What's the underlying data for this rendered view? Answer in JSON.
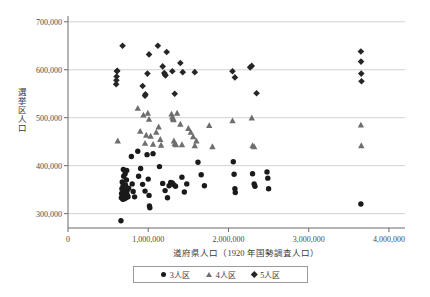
{
  "chart_data": {
    "type": "scatter",
    "title": "",
    "xlabel": "道府県人口（1920 年国勢調査人口）",
    "ylabel": "選挙区人口",
    "xlim": [
      0,
      4200000
    ],
    "ylim": [
      270000,
      710000
    ],
    "grid": "horizontal",
    "legend_position": "bottom-center",
    "x_ticks": [
      {
        "value": 0,
        "label": "0"
      },
      {
        "value": 1000000,
        "label": "1,000,000"
      },
      {
        "value": 2000000,
        "label": "2,000,000"
      },
      {
        "value": 3000000,
        "label": "3,000,000"
      },
      {
        "value": 4000000,
        "label": "4,000,000"
      }
    ],
    "y_ticks": [
      {
        "value": 300000,
        "label": "300,000"
      },
      {
        "value": 400000,
        "label": "400,000"
      },
      {
        "value": 500000,
        "label": "500,000"
      },
      {
        "value": 600000,
        "label": "600,000"
      },
      {
        "value": 700000,
        "label": "700,000"
      }
    ],
    "series": [
      {
        "name": "3人区",
        "marker": "circle",
        "color": "#1a1a1a",
        "points": [
          [
            660000,
            285000
          ],
          [
            665000,
            333000
          ],
          [
            668000,
            342000
          ],
          [
            672000,
            352000
          ],
          [
            676000,
            366000
          ],
          [
            680000,
            337000
          ],
          [
            683000,
            330000
          ],
          [
            686000,
            358000
          ],
          [
            690000,
            392000
          ],
          [
            694000,
            378000
          ],
          [
            697000,
            345000
          ],
          [
            700000,
            336000
          ],
          [
            704000,
            331000
          ],
          [
            708000,
            350000
          ],
          [
            712000,
            383000
          ],
          [
            716000,
            360000
          ],
          [
            720000,
            340000
          ],
          [
            724000,
            333000
          ],
          [
            728000,
            370000
          ],
          [
            732000,
            390000
          ],
          [
            736000,
            347000
          ],
          [
            742000,
            338000
          ],
          [
            748000,
            335000
          ],
          [
            756000,
            353000
          ],
          [
            790000,
            419000
          ],
          [
            800000,
            362000
          ],
          [
            812000,
            346000
          ],
          [
            830000,
            335000
          ],
          [
            870000,
            430000
          ],
          [
            880000,
            378000
          ],
          [
            905000,
            394000
          ],
          [
            930000,
            361000
          ],
          [
            960000,
            347000
          ],
          [
            985000,
            423000
          ],
          [
            1000000,
            372000
          ],
          [
            1010000,
            338000
          ],
          [
            1015000,
            316000
          ],
          [
            1020000,
            312000
          ],
          [
            1060000,
            425000
          ],
          [
            1140000,
            398000
          ],
          [
            1180000,
            363000
          ],
          [
            1210000,
            348000
          ],
          [
            1240000,
            333000
          ],
          [
            1260000,
            358000
          ],
          [
            1280000,
            365000
          ],
          [
            1300000,
            364000
          ],
          [
            1320000,
            360000
          ],
          [
            1340000,
            357000
          ],
          [
            1420000,
            376000
          ],
          [
            1450000,
            345000
          ],
          [
            1480000,
            362000
          ],
          [
            1620000,
            407000
          ],
          [
            1660000,
            381000
          ],
          [
            1700000,
            358000
          ],
          [
            2060000,
            408000
          ],
          [
            2070000,
            382000
          ],
          [
            2080000,
            352000
          ],
          [
            2085000,
            344000
          ],
          [
            2300000,
            383000
          ],
          [
            2320000,
            362000
          ],
          [
            2330000,
            357000
          ],
          [
            2480000,
            387000
          ],
          [
            2490000,
            374000
          ],
          [
            2500000,
            352000
          ],
          [
            3650000,
            320000
          ]
        ]
      },
      {
        "name": "4人区",
        "marker": "triangle",
        "color": "#6e6e6e",
        "points": [
          [
            620000,
            452000
          ],
          [
            870000,
            520000
          ],
          [
            900000,
            472000
          ],
          [
            940000,
            506000
          ],
          [
            960000,
            447000
          ],
          [
            975000,
            464000
          ],
          [
            995000,
            510000
          ],
          [
            1010000,
            497000
          ],
          [
            1030000,
            462000
          ],
          [
            1060000,
            445000
          ],
          [
            1100000,
            470000
          ],
          [
            1130000,
            481000
          ],
          [
            1150000,
            455000
          ],
          [
            1160000,
            443000
          ],
          [
            1290000,
            508000
          ],
          [
            1300000,
            502000
          ],
          [
            1310000,
            499000
          ],
          [
            1315000,
            496000
          ],
          [
            1320000,
            452000
          ],
          [
            1330000,
            446000
          ],
          [
            1345000,
            444000
          ],
          [
            1360000,
            510000
          ],
          [
            1400000,
            487000
          ],
          [
            1420000,
            444000
          ],
          [
            1500000,
            478000
          ],
          [
            1530000,
            470000
          ],
          [
            1560000,
            461000
          ],
          [
            1580000,
            442000
          ],
          [
            1600000,
            452000
          ],
          [
            1760000,
            484000
          ],
          [
            1800000,
            440000
          ],
          [
            2050000,
            494000
          ],
          [
            2290000,
            500000
          ],
          [
            2300000,
            442000
          ],
          [
            2320000,
            440000
          ],
          [
            3650000,
            485000
          ],
          [
            3655000,
            442000
          ]
        ]
      },
      {
        "name": "5人区",
        "marker": "diamond",
        "color": "#262626",
        "points": [
          [
            600000,
            570000
          ],
          [
            603000,
            578000
          ],
          [
            606000,
            586000
          ],
          [
            610000,
            597000
          ],
          [
            614000,
            598000
          ],
          [
            680000,
            650000
          ],
          [
            930000,
            566000
          ],
          [
            960000,
            546000
          ],
          [
            965000,
            549000
          ],
          [
            990000,
            592000
          ],
          [
            1010000,
            632000
          ],
          [
            1120000,
            650000
          ],
          [
            1180000,
            607000
          ],
          [
            1200000,
            593000
          ],
          [
            1210000,
            590000
          ],
          [
            1215000,
            588000
          ],
          [
            1230000,
            637000
          ],
          [
            1300000,
            597000
          ],
          [
            1330000,
            550000
          ],
          [
            1400000,
            614000
          ],
          [
            1430000,
            595000
          ],
          [
            1580000,
            595000
          ],
          [
            2050000,
            597000
          ],
          [
            2080000,
            584000
          ],
          [
            2270000,
            605000
          ],
          [
            2290000,
            608000
          ],
          [
            2350000,
            551000
          ],
          [
            3650000,
            638000
          ],
          [
            3652000,
            617000
          ],
          [
            3655000,
            592000
          ],
          [
            3658000,
            576000
          ]
        ]
      }
    ]
  },
  "legend": {
    "items": [
      {
        "label": "3人区",
        "marker": "circle"
      },
      {
        "label": "4人区",
        "marker": "triangle"
      },
      {
        "label": "5人区",
        "marker": "diamond"
      }
    ]
  }
}
